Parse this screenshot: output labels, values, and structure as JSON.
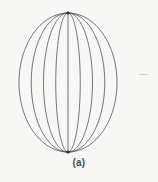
{
  "figure": {
    "caption": "(a)",
    "background_color": "#f7f7f5",
    "line_color": "#4a4a52",
    "pole_color": "#2b2b30",
    "artifact_color": "#cfcfcb"
  },
  "chart_data": {
    "type": "line",
    "title": "(a)",
    "subtitle": "",
    "xlabel": "",
    "ylabel": "",
    "grid": false,
    "legend": null,
    "axis_visible": false,
    "tick_labels": [],
    "annotations": [
      {
        "text": "(a)",
        "x": 68,
        "y": 165,
        "role": "figure-label"
      }
    ],
    "geometry": {
      "north_pole": {
        "x": 68,
        "y": 13
      },
      "south_pole": {
        "x": 68,
        "y": 152
      },
      "center": {
        "x": 68,
        "y": 82.5
      },
      "semi_width": 49,
      "semi_height": 69.5,
      "xlim": [
        19,
        117
      ],
      "ylim": [
        13,
        152
      ],
      "line_width": 0.8
    },
    "categories": [
      "meridian-1",
      "meridian-2",
      "meridian-3",
      "meridian-4",
      "meridian-5",
      "meridian-6",
      "meridian-7",
      "meridian-8",
      "meridian-9"
    ],
    "values": [
      -49,
      -36.75,
      -24.5,
      -12.25,
      0,
      12.25,
      24.5,
      36.75,
      49
    ],
    "series": [
      {
        "name": "meridian-1",
        "equator_offset": -49,
        "equator_x": 19
      },
      {
        "name": "meridian-2",
        "equator_offset": -36.75,
        "equator_x": 31.25
      },
      {
        "name": "meridian-3",
        "equator_offset": -24.5,
        "equator_x": 43.5
      },
      {
        "name": "meridian-4",
        "equator_offset": -12.25,
        "equator_x": 55.75
      },
      {
        "name": "meridian-5",
        "equator_offset": 0,
        "equator_x": 68
      },
      {
        "name": "meridian-6",
        "equator_offset": 12.25,
        "equator_x": 80.25
      },
      {
        "name": "meridian-7",
        "equator_offset": 24.5,
        "equator_x": 92.5
      },
      {
        "name": "meridian-8",
        "equator_offset": 36.75,
        "equator_x": 104.75
      },
      {
        "name": "meridian-9",
        "equator_offset": 49,
        "equator_x": 117
      }
    ],
    "curve_count": 9
  }
}
